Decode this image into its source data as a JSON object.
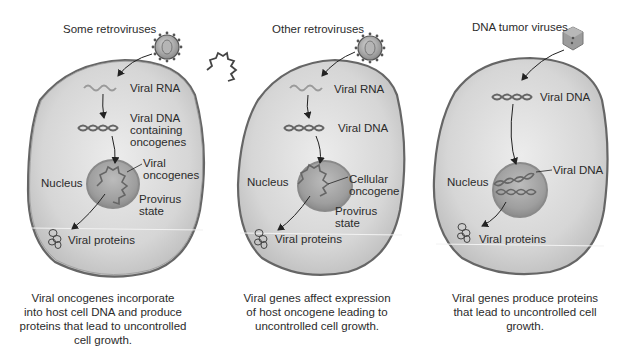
{
  "colors": {
    "cell_fill": "#d9d9d9",
    "cell_edge": "#555555",
    "nucleus_fill": "#a9a9a9",
    "arrow": "#222222",
    "background": "#ffffff"
  },
  "panels": [
    {
      "title": "Some retroviruses",
      "virus_icon": "spherical-spiked-virus-icon",
      "labels": {
        "viral_rna": "Viral RNA",
        "viral_dna": "Viral DNA",
        "viral_dna_sub1": "containing",
        "viral_dna_sub2": "oncogenes",
        "gene_a": "Viral",
        "gene_b": "oncogenes",
        "nucleus": "Nucleus",
        "provirus_a": "Provirus",
        "provirus_b": "state",
        "proteins": "Viral proteins"
      },
      "caption": [
        "Viral oncogenes incorporate",
        "into host cell DNA and produce",
        "proteins that lead to uncontrolled",
        "cell growth."
      ]
    },
    {
      "title": "Other retroviruses",
      "virus_icon": "spherical-spiked-virus-icon",
      "labels": {
        "viral_rna": "Viral RNA",
        "viral_dna": "Viral DNA",
        "gene_a": "Cellular",
        "gene_b": "oncogene",
        "nucleus": "Nucleus",
        "provirus_a": "Provirus",
        "provirus_b": "state",
        "proteins": "Viral proteins"
      },
      "caption": [
        "Viral genes affect expression",
        "of host oncogene leading to",
        "uncontrolled cell growth."
      ]
    },
    {
      "title": "DNA tumor viruses",
      "virus_icon": "icosahedral-virus-icon",
      "labels": {
        "viral_dna": "Viral DNA",
        "viral_dna_nucleus": "Viral DNA",
        "nucleus": "Nucleus",
        "proteins": "Viral proteins"
      },
      "caption": [
        "Viral genes produce proteins",
        "that lead to uncontrolled cell",
        "growth."
      ]
    }
  ]
}
